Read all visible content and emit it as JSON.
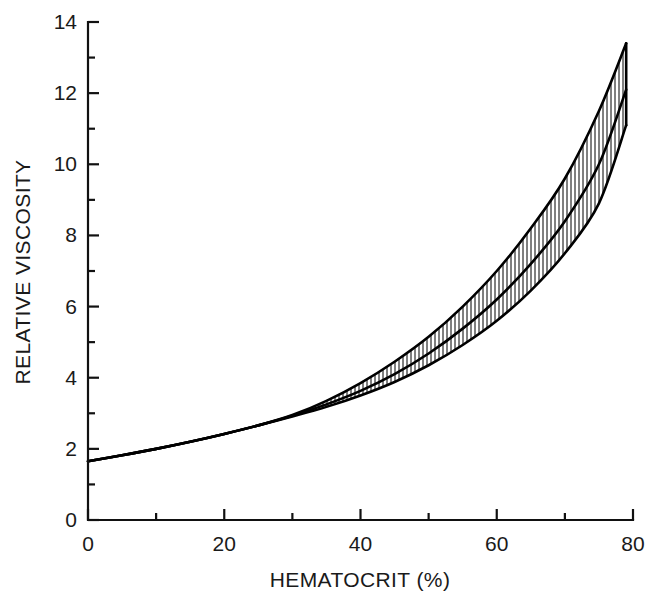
{
  "figure": {
    "background_color": "#ffffff",
    "line_color": "#000000",
    "text_color": "#1a1a1a"
  },
  "chart_data": {
    "type": "line",
    "title": "",
    "subtitle": "",
    "xlabel": "HEMATOCRIT (%)",
    "ylabel": "RELATIVE VISCOSITY",
    "xlim": [
      0,
      80
    ],
    "ylim": [
      0,
      14
    ],
    "xticks": [
      0,
      20,
      40,
      60,
      80
    ],
    "xtick_labels": [
      "0",
      "20",
      "40",
      "60",
      "80"
    ],
    "xticks_minor": [
      10,
      30,
      50,
      70
    ],
    "yticks": [
      0,
      2,
      4,
      6,
      8,
      10,
      12,
      14
    ],
    "ytick_labels": [
      "0",
      "2",
      "4",
      "6",
      "8",
      "10",
      "12",
      "14"
    ],
    "yticks_minor": [
      1,
      3,
      5,
      7,
      9,
      11,
      13
    ],
    "grid": false,
    "legend": null,
    "legend_position": "none",
    "annotations": [],
    "band_style": "vertical-hatch",
    "band_opens_at_x": 31,
    "x": [
      0,
      5,
      10,
      15,
      20,
      25,
      30,
      35,
      40,
      45,
      50,
      55,
      60,
      65,
      70,
      75,
      79
    ],
    "series": [
      {
        "name": "upper bound",
        "values": [
          1.65,
          1.82,
          2.0,
          2.2,
          2.42,
          2.66,
          2.95,
          3.35,
          3.85,
          4.45,
          5.15,
          6.0,
          7.0,
          8.2,
          9.6,
          11.5,
          13.4
        ]
      },
      {
        "name": "mean relative viscosity",
        "values": [
          1.65,
          1.82,
          2.0,
          2.2,
          2.42,
          2.66,
          2.93,
          3.25,
          3.63,
          4.1,
          4.68,
          5.38,
          6.2,
          7.2,
          8.4,
          10.0,
          12.1
        ]
      },
      {
        "name": "lower bound",
        "values": [
          1.65,
          1.82,
          2.0,
          2.2,
          2.42,
          2.66,
          2.91,
          3.18,
          3.5,
          3.88,
          4.35,
          4.92,
          5.6,
          6.45,
          7.5,
          8.9,
          11.1
        ]
      }
    ]
  }
}
